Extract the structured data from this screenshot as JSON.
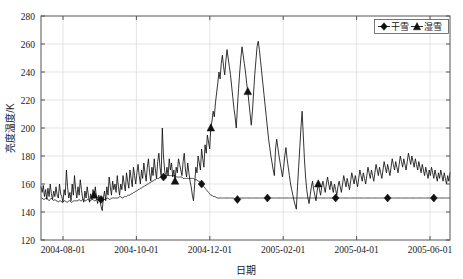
{
  "chart_data": {
    "type": "line",
    "title": "",
    "xlabel": "日期",
    "ylabel": "亮度温度/K",
    "grid": true,
    "legend_position": "top-right",
    "ylim": [
      120,
      280
    ],
    "yticks": [
      120,
      140,
      160,
      180,
      200,
      220,
      240,
      260,
      280
    ],
    "xticks": [
      "2004-08-01",
      "2004-10-01",
      "2004-12-01",
      "2005-02-01",
      "2005-04-01",
      "2005-06-01"
    ],
    "xlim": [
      "2004-07-05",
      "2005-06-25"
    ],
    "series": [
      {
        "name": "干雪",
        "marker": "diamond",
        "color": "#111111",
        "description": "Smooth lower curve, mostly 145-170 K",
        "values": [
          150,
          150,
          149,
          149,
          150,
          150,
          149,
          148,
          149,
          150,
          149,
          148,
          149,
          148,
          148,
          147,
          148,
          148,
          147,
          147,
          148,
          148,
          147,
          147,
          148,
          148,
          147,
          147,
          148,
          148,
          148,
          148,
          148,
          149,
          148,
          148,
          149,
          149,
          148,
          148,
          149,
          149,
          148,
          148,
          149,
          149,
          148,
          148,
          149,
          149,
          148,
          149,
          149,
          149,
          149,
          149,
          149,
          150,
          150,
          149,
          149,
          150,
          150,
          150,
          150,
          150,
          150,
          150,
          151,
          151,
          150,
          150,
          151,
          151,
          151,
          152,
          152,
          152,
          153,
          153,
          154,
          154,
          155,
          155,
          156,
          156,
          157,
          157,
          158,
          158,
          159,
          159,
          160,
          160,
          161,
          161,
          162,
          162,
          163,
          163,
          164,
          164,
          164,
          165,
          165,
          165,
          165,
          166,
          166,
          166,
          166,
          166,
          166,
          166,
          166,
          166,
          166,
          165,
          165,
          165,
          165,
          165,
          165,
          164,
          164,
          164,
          164,
          164,
          164,
          164,
          164,
          164,
          164,
          163,
          163,
          163,
          162,
          162,
          161,
          160,
          159,
          158,
          157,
          156,
          155,
          154,
          153,
          152,
          152,
          151,
          151,
          151,
          150,
          150,
          150,
          150,
          150,
          150,
          150,
          150,
          150,
          150,
          150,
          150,
          150,
          150,
          150,
          150,
          149,
          149,
          149,
          149,
          150,
          150,
          150,
          150,
          150,
          150,
          150,
          150,
          150,
          150,
          150,
          150,
          150,
          150,
          150,
          150,
          150,
          150,
          150,
          150,
          150,
          150,
          150,
          150,
          150,
          150,
          150,
          150,
          150,
          150,
          150,
          150,
          150,
          150,
          150,
          150,
          150,
          150,
          150,
          150,
          150,
          150,
          150,
          150,
          150,
          150,
          150,
          150,
          150,
          150,
          150,
          150,
          150,
          150,
          150,
          150,
          150,
          150,
          150,
          150,
          150,
          150,
          150,
          150,
          150,
          150,
          150,
          150,
          150,
          150,
          150,
          150,
          150,
          150,
          150,
          150,
          150,
          150,
          150,
          150,
          150,
          150,
          150,
          150,
          150,
          150,
          150,
          150,
          150,
          150,
          150,
          150,
          150,
          150,
          150,
          150,
          150,
          150,
          150,
          150,
          150,
          150,
          150,
          150,
          150,
          150,
          150,
          150,
          150,
          150,
          150,
          150,
          150,
          150,
          150,
          150,
          150,
          150,
          150,
          150,
          150,
          150,
          150,
          150,
          150,
          150,
          150,
          150,
          150,
          150,
          150,
          150,
          150,
          150,
          150,
          150,
          150,
          150,
          150,
          150,
          150,
          150,
          150,
          150,
          150,
          150,
          150,
          150,
          150,
          150,
          150,
          150,
          150,
          150,
          150,
          150,
          150,
          150,
          150,
          150,
          150,
          150,
          150,
          150,
          150,
          150,
          150,
          150,
          150,
          150,
          150,
          150,
          150,
          150,
          150,
          150,
          150,
          150,
          150,
          150,
          150,
          150,
          150
        ],
        "marker_indices": [
          52,
          106,
          139,
          170,
          196,
          255,
          300,
          340
        ]
      },
      {
        "name": "湿雪",
        "marker": "triangle",
        "color": "#111111",
        "description": "Noisy upper curve, 140-262 K, major melt spike Dec 2004 - Feb 2005",
        "values": [
          158,
          154,
          159,
          151,
          156,
          149,
          157,
          151,
          160,
          153,
          149,
          155,
          151,
          158,
          152,
          150,
          160,
          153,
          151,
          147,
          156,
          152,
          170,
          158,
          150,
          154,
          148,
          160,
          152,
          166,
          156,
          150,
          158,
          152,
          163,
          156,
          150,
          147,
          155,
          150,
          158,
          152,
          147,
          153,
          149,
          156,
          152,
          158,
          150,
          146,
          152,
          148,
          144,
          141,
          150,
          155,
          148,
          158,
          152,
          165,
          158,
          152,
          162,
          156,
          160,
          154,
          166,
          158,
          152,
          160,
          156,
          166,
          160,
          155,
          168,
          162,
          157,
          170,
          164,
          158,
          172,
          166,
          160,
          168,
          174,
          166,
          160,
          170,
          164,
          175,
          168,
          162,
          172,
          178,
          168,
          162,
          172,
          166,
          178,
          170,
          164,
          176,
          182,
          172,
          166,
          200,
          180,
          170,
          164,
          172,
          166,
          178,
          170,
          175,
          165,
          170,
          162,
          172,
          168,
          178,
          174,
          170,
          166,
          176,
          182,
          170,
          165,
          175,
          168,
          162,
          158,
          152,
          148,
          160,
          172,
          168,
          180,
          175,
          170,
          185,
          178,
          172,
          188,
          182,
          195,
          190,
          185,
          200,
          205,
          212,
          208,
          218,
          225,
          232,
          240,
          235,
          246,
          252,
          244,
          238,
          248,
          256,
          250,
          244,
          238,
          230,
          222,
          214,
          208,
          200,
          215,
          228,
          240,
          250,
          258,
          252,
          246,
          240,
          232,
          226,
          218,
          210,
          202,
          212,
          225,
          238,
          248,
          258,
          262,
          256,
          248,
          240,
          232,
          224,
          216,
          208,
          200,
          192,
          186,
          180,
          175,
          170,
          166,
          185,
          192,
          186,
          180,
          175,
          170,
          165,
          172,
          180,
          186,
          178,
          172,
          166,
          160,
          156,
          152,
          148,
          145,
          142,
          158,
          172,
          186,
          200,
          212,
          195,
          178,
          165,
          156,
          150,
          146,
          152,
          158,
          162,
          156,
          152,
          148,
          155,
          160,
          156,
          152,
          158,
          162,
          158,
          154,
          160,
          165,
          160,
          156,
          162,
          158,
          154,
          160,
          156,
          152,
          158,
          162,
          158,
          154,
          160,
          166,
          162,
          158,
          164,
          160,
          156,
          162,
          168,
          164,
          160,
          166,
          162,
          158,
          164,
          170,
          166,
          162,
          168,
          164,
          160,
          166,
          172,
          168,
          164,
          170,
          166,
          162,
          168,
          174,
          170,
          166,
          172,
          168,
          164,
          170,
          176,
          172,
          168,
          174,
          170,
          166,
          172,
          178,
          174,
          170,
          176,
          172,
          168,
          174,
          180,
          176,
          172,
          178,
          174,
          170,
          176,
          182,
          178,
          174,
          180,
          176,
          172,
          178,
          174,
          170,
          176,
          172,
          168,
          174,
          170,
          166,
          172,
          168,
          164,
          170,
          166,
          172,
          168,
          164,
          170,
          166,
          162,
          168,
          164,
          170,
          166,
          162,
          168,
          164,
          160,
          166,
          162,
          168
        ],
        "marker_indices": [
          46,
          116,
          147,
          179,
          240
        ]
      }
    ]
  },
  "legend": {
    "items": [
      {
        "label": "干雪",
        "marker": "diamond"
      },
      {
        "label": "湿雪",
        "marker": "triangle"
      }
    ]
  },
  "axes": {
    "y_title": "亮度温度/K",
    "x_title": "日期",
    "y_tick_labels": [
      "280",
      "260",
      "240",
      "220",
      "200",
      "180",
      "160",
      "140",
      "120"
    ],
    "x_tick_labels": [
      "2004-08-01",
      "2004-10-01",
      "2004-12-01",
      "2005-02-01",
      "2005-04-01",
      "2005-06-01"
    ]
  }
}
